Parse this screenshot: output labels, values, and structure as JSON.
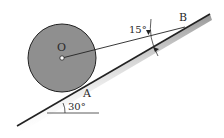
{
  "diagram": {
    "labels": {
      "center": "O",
      "contact_point": "A",
      "cord_anchor": "B",
      "cord_angle": "15°",
      "incline_angle": "30°"
    },
    "geometry": {
      "incline_angle_deg": 30,
      "cord_angle_to_incline_deg": 15,
      "sphere_center": [
        62,
        58
      ],
      "sphere_radius": 34,
      "incline_start": [
        17,
        126
      ],
      "incline_end": [
        210,
        14
      ],
      "cord_end_B": [
        185,
        27
      ]
    },
    "colors": {
      "sphere_fill": "#8f8f8f",
      "outline": "#222222",
      "background": "#ffffff"
    }
  }
}
